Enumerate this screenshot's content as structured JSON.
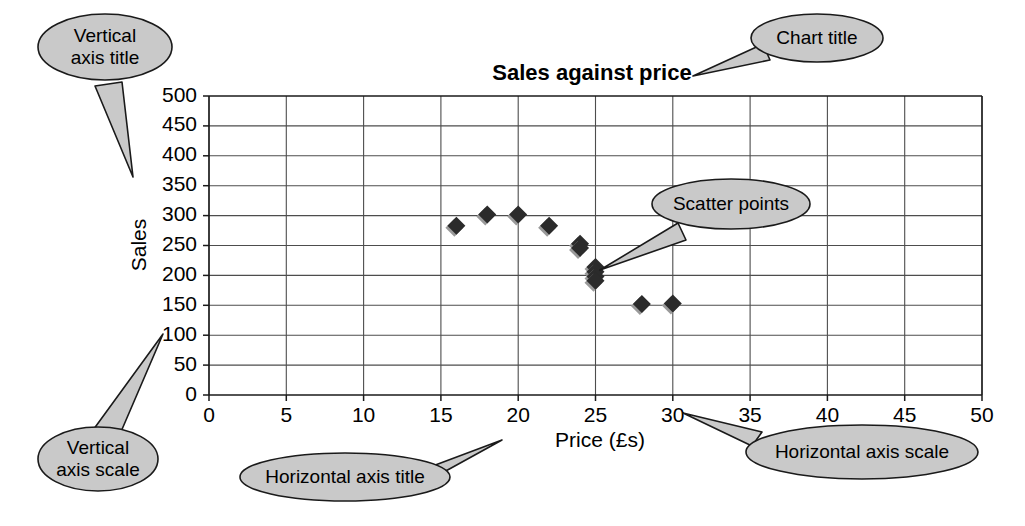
{
  "chart_data": {
    "type": "scatter",
    "title": "Sales against price",
    "xlabel": "Price (£s)",
    "ylabel": "Sales",
    "xlim": [
      0,
      50
    ],
    "ylim": [
      0,
      500
    ],
    "x_ticks": [
      "0",
      "5",
      "10",
      "15",
      "20",
      "25",
      "30",
      "35",
      "40",
      "45",
      "50"
    ],
    "y_ticks": [
      "0",
      "50",
      "100",
      "150",
      "200",
      "250",
      "300",
      "350",
      "400",
      "450",
      "500"
    ],
    "x_tick_values": [
      0,
      5,
      10,
      15,
      20,
      25,
      30,
      35,
      40,
      45,
      50
    ],
    "y_tick_values": [
      0,
      50,
      100,
      150,
      200,
      250,
      300,
      350,
      400,
      450,
      500
    ],
    "grid": "both",
    "legend": "none",
    "marker": "diamond",
    "marker_color": "#2b2b2b",
    "series": [
      {
        "name": "Sales",
        "points": [
          {
            "x": 16,
            "y": 283
          },
          {
            "x": 18,
            "y": 302
          },
          {
            "x": 20,
            "y": 302
          },
          {
            "x": 22,
            "y": 283
          },
          {
            "x": 24,
            "y": 253
          },
          {
            "x": 24,
            "y": 246
          },
          {
            "x": 25,
            "y": 214
          },
          {
            "x": 25,
            "y": 206
          },
          {
            "x": 25,
            "y": 198
          },
          {
            "x": 25,
            "y": 191
          },
          {
            "x": 28,
            "y": 152
          },
          {
            "x": 30,
            "y": 153
          }
        ]
      }
    ]
  },
  "annotations": {
    "vertical_axis_title": "Vertical\naxis title",
    "vertical_axis_title_l1": "Vertical",
    "vertical_axis_title_l2": "axis title",
    "vertical_axis_scale_l1": "Vertical",
    "vertical_axis_scale_l2": "axis scale",
    "chart_title_callout": "Chart title",
    "scatter_points_callout": "Scatter points",
    "horizontal_axis_title_callout": "Horizontal axis title",
    "horizontal_axis_scale_callout": "Horizontal axis scale"
  },
  "colors": {
    "callout_fill": "#c9c9c9",
    "callout_stroke": "#1a1a1a",
    "grid": "#4d4d4d",
    "marker": "#2b2b2b",
    "background": "#ffffff"
  }
}
